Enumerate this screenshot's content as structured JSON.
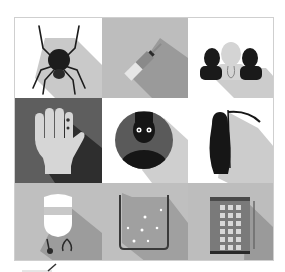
{
  "image": {
    "description": "3x3 grid of flat grayscale icons with long diagonal shadows",
    "tiles": [
      {
        "id": "spider",
        "icon": "spider-icon",
        "bg": "#ffffff",
        "shadow": "#c9c9c9",
        "fg": "#1c1c1c"
      },
      {
        "id": "syringe",
        "icon": "syringe-icon",
        "bg": "#bdbdbd",
        "shadow": "#9a9a9a",
        "fg": "#7a7a7a"
      },
      {
        "id": "people-group",
        "icon": "people-group-icon",
        "bg": "#ffffff",
        "shadow": "#cccccc",
        "fg": "#1a1a1a"
      },
      {
        "id": "injured-hand",
        "icon": "hand-icon",
        "bg": "#5e5e5e",
        "shadow": "#2e2e2e",
        "fg": "#d6d6d6"
      },
      {
        "id": "scared-person",
        "icon": "person-avatar-icon",
        "bg": "#ffffff",
        "shadow": "#cfcfcf",
        "fg": "#161616"
      },
      {
        "id": "grim-reaper",
        "icon": "grim-reaper-icon",
        "bg": "#ffffff",
        "shadow": "#cccccc",
        "fg": "#161616"
      },
      {
        "id": "doctor",
        "icon": "doctor-icon",
        "bg": "#bfbfbf",
        "shadow": "#9c9c9c",
        "fg": "#ffffff"
      },
      {
        "id": "beaker",
        "icon": "beaker-icon",
        "bg": "#bfbfbf",
        "shadow": "#a0a0a0",
        "fg": "#3a3a3a"
      },
      {
        "id": "hospital-building",
        "icon": "building-icon",
        "bg": "#bdbdbd",
        "shadow": "#9a9a9a",
        "fg": "#6a6a6a"
      }
    ]
  }
}
